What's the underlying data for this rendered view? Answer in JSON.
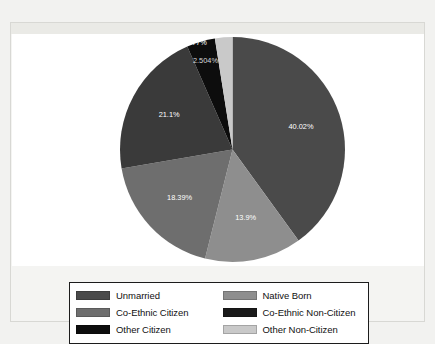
{
  "chart_data": {
    "type": "pie",
    "title": "",
    "labels": [
      "Unmarried",
      "Native Born",
      "Co-Ethnic Citizen",
      "Other Citizen",
      "Co-Ethnic Non-Citizen",
      "Other Non-Citizen"
    ],
    "values": [
      40.02,
      13.9,
      18.39,
      21.1,
      4.077,
      2.504
    ],
    "value_labels": [
      "40.02%",
      "13.9%",
      "18.39%",
      "21.1%",
      "4.077%",
      "2.504%"
    ],
    "colors": [
      "#4a4a4a",
      "#8e8e8e",
      "#6e6e6e",
      "#3a3a3a",
      "#0d0d0d",
      "#c9c9c9"
    ],
    "start_angle_deg": 0,
    "direction": "clockwise",
    "legend_position": "bottom",
    "legend_columns": 2,
    "grid": false
  },
  "legend": {
    "items": [
      {
        "label": "Unmarried",
        "color": "#4a4a4a"
      },
      {
        "label": "Native Born",
        "color": "#8e8e8e"
      },
      {
        "label": "Co-Ethnic Citizen",
        "color": "#6e6e6e"
      },
      {
        "label": "Co-Ethnic Non-Citizen",
        "color": "#1a1a1a"
      },
      {
        "label": "Other Citizen",
        "color": "#0d0d0d"
      },
      {
        "label": "Other Non-Citizen",
        "color": "#c9c9c9"
      }
    ]
  }
}
